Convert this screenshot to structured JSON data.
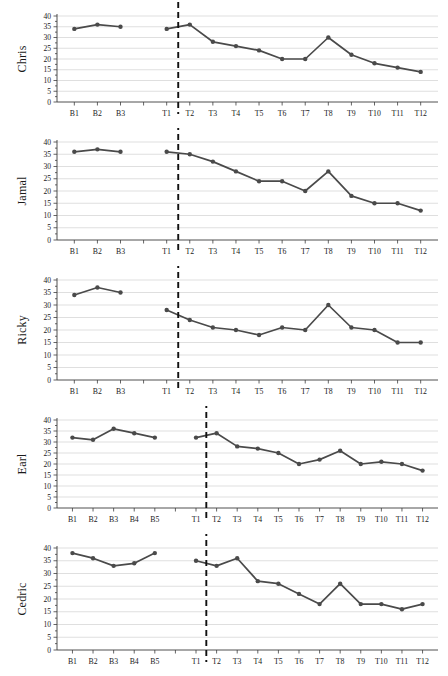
{
  "figure": {
    "type": "multi-panel-single-case-line-graph",
    "y_axis": {
      "label_unit": "",
      "ticks": [
        0,
        5,
        10,
        15,
        20,
        25,
        30,
        35,
        40
      ],
      "min": 0,
      "max": 40,
      "step": 5
    },
    "colors": {
      "series": "#4a4a4a",
      "gridline": "#c9c9c9",
      "axis": "#3d3d3d",
      "phase_line": "#111111",
      "background": "#ffffff"
    },
    "phase_line_note": "vertical dashed phase-change line between T1 and T2"
  },
  "chart_data": [
    {
      "type": "line",
      "title": "Chris",
      "ylabel": "Chris",
      "xlabel": "",
      "ylim": [
        0,
        40
      ],
      "grid": true,
      "legend": "none",
      "yticks": [
        0,
        5,
        10,
        15,
        20,
        25,
        30,
        35,
        40
      ],
      "baseline_labels": [
        "B1",
        "B2",
        "B3"
      ],
      "treatment_labels": [
        "T1",
        "T2",
        "T3",
        "T4",
        "T5",
        "T6",
        "T7",
        "T8",
        "T9",
        "T10",
        "T11",
        "T12"
      ],
      "baseline_values": [
        34,
        36,
        35
      ],
      "treatment_values": [
        34,
        36,
        28,
        26,
        24,
        20,
        20,
        30,
        22,
        18,
        16,
        14
      ],
      "phase_line_after": "T1"
    },
    {
      "type": "line",
      "title": "Jamal",
      "ylabel": "Jamal",
      "xlabel": "",
      "ylim": [
        0,
        40
      ],
      "grid": true,
      "legend": "none",
      "yticks": [
        0,
        5,
        10,
        15,
        20,
        25,
        30,
        35,
        40
      ],
      "baseline_labels": [
        "B1",
        "B2",
        "B3"
      ],
      "treatment_labels": [
        "T1",
        "T2",
        "T3",
        "T4",
        "T5",
        "T6",
        "T7",
        "T8",
        "T9",
        "T10",
        "T11",
        "T12"
      ],
      "baseline_values": [
        36,
        37,
        36
      ],
      "treatment_values": [
        36,
        35,
        32,
        28,
        24,
        24,
        20,
        28,
        18,
        15,
        15,
        12
      ],
      "phase_line_after": "T1"
    },
    {
      "type": "line",
      "title": "Ricky",
      "ylabel": "Ricky",
      "xlabel": "",
      "ylim": [
        0,
        40
      ],
      "grid": true,
      "legend": "none",
      "yticks": [
        0,
        5,
        10,
        15,
        20,
        25,
        30,
        35,
        40
      ],
      "baseline_labels": [
        "B1",
        "B2",
        "B3"
      ],
      "treatment_labels": [
        "T1",
        "T2",
        "T3",
        "T4",
        "T5",
        "T6",
        "T7",
        "T8",
        "T9",
        "T10",
        "T11",
        "T12"
      ],
      "baseline_values": [
        34,
        37,
        35
      ],
      "treatment_values": [
        28,
        24,
        21,
        20,
        18,
        21,
        20,
        30,
        21,
        20,
        15,
        15
      ],
      "phase_line_after": "T1"
    },
    {
      "type": "line",
      "title": "Earl",
      "ylabel": "Earl",
      "xlabel": "",
      "ylim": [
        0,
        40
      ],
      "grid": true,
      "legend": "none",
      "yticks": [
        0,
        5,
        10,
        15,
        20,
        25,
        30,
        35,
        40
      ],
      "baseline_labels": [
        "B1",
        "B2",
        "B3",
        "B4",
        "B5"
      ],
      "treatment_labels": [
        "T1",
        "T2",
        "T3",
        "T4",
        "T5",
        "T6",
        "T7",
        "T8",
        "T9",
        "T10",
        "T11",
        "T12"
      ],
      "baseline_values": [
        32,
        31,
        36,
        34,
        32
      ],
      "treatment_values": [
        32,
        34,
        28,
        27,
        25,
        20,
        22,
        26,
        20,
        21,
        20,
        17
      ],
      "phase_line_after": "T1"
    },
    {
      "type": "line",
      "title": "Cedric",
      "ylabel": "Cedric",
      "xlabel": "",
      "ylim": [
        0,
        40
      ],
      "grid": true,
      "legend": "none",
      "yticks": [
        0,
        5,
        10,
        15,
        20,
        25,
        30,
        35,
        40
      ],
      "baseline_labels": [
        "B1",
        "B2",
        "B3",
        "B4",
        "B5"
      ],
      "treatment_labels": [
        "T1",
        "T2",
        "T3",
        "T4",
        "T5",
        "T6",
        "T7",
        "T8",
        "T9",
        "T10",
        "T11",
        "T12"
      ],
      "baseline_values": [
        38,
        36,
        33,
        34,
        38
      ],
      "treatment_values": [
        35,
        33,
        36,
        27,
        26,
        22,
        18,
        26,
        18,
        18,
        16,
        18
      ],
      "phase_line_after": "T1"
    }
  ]
}
